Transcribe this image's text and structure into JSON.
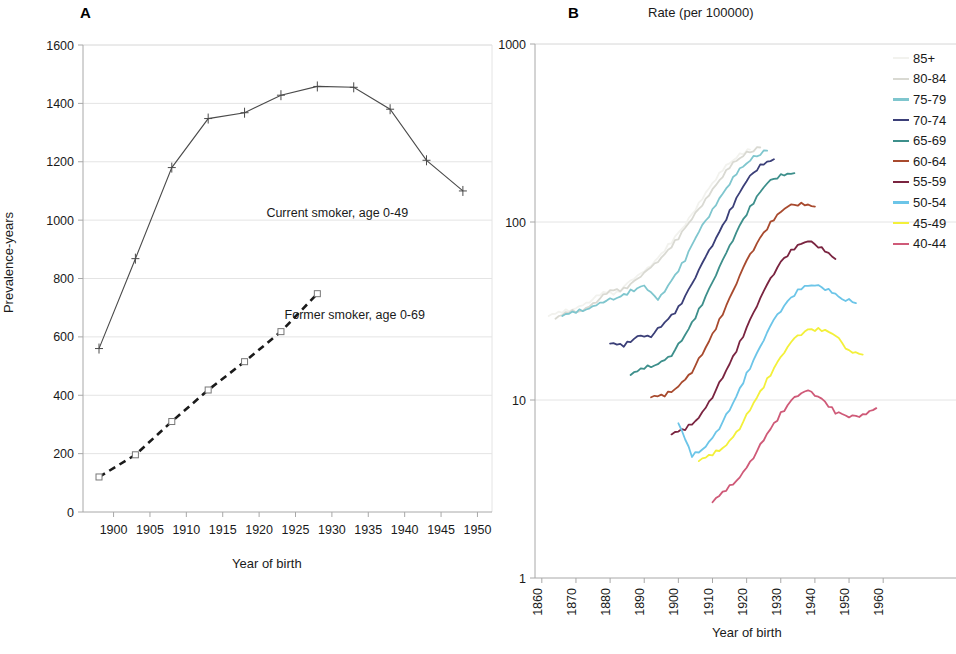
{
  "figure": {
    "panel_a_letter": "A",
    "panel_b_letter": "B",
    "panel_b_title": "Rate (per 100000)"
  },
  "chart_data": [
    {
      "id": "panel_a",
      "type": "line",
      "title": "A",
      "xlabel": "Year of birth",
      "ylabel": "Prevalence-years",
      "xlim": [
        1895.8,
        1952.0
      ],
      "ylim": [
        0,
        1600
      ],
      "xticks": [
        1900,
        1905,
        1910,
        1915,
        1920,
        1925,
        1930,
        1935,
        1940,
        1945,
        1950
      ],
      "yticks": [
        0,
        200,
        400,
        600,
        800,
        1000,
        1200,
        1400,
        1600
      ],
      "grid": true,
      "annotations": [
        {
          "text": "Current smoker, age 0-49",
          "x": 1921.0,
          "y": 1010
        },
        {
          "text": "Former smoker, age 0-69",
          "x": 1923.5,
          "y": 660
        }
      ],
      "series": [
        {
          "name": "Current smoker, age 0-49",
          "marker": "plus",
          "linestyle": "solid",
          "color": "#4a4a4a",
          "x": [
            1898,
            1903,
            1908,
            1913,
            1918,
            1923,
            1928,
            1933,
            1938,
            1943,
            1948
          ],
          "values": [
            560,
            868,
            1180,
            1348,
            1368,
            1428,
            1458,
            1455,
            1380,
            1205,
            1100
          ]
        },
        {
          "name": "Former smoker, age 0-69",
          "marker": "square",
          "linestyle": "dashed",
          "color": "#1a1a1a",
          "x": [
            1898,
            1903,
            1908,
            1913,
            1918,
            1923,
            1928
          ],
          "values": [
            120,
            196,
            310,
            418,
            515,
            618,
            748
          ]
        }
      ]
    },
    {
      "id": "panel_b",
      "type": "line",
      "title": "Rate (per 100000)",
      "xlabel": "Year of birth",
      "ylabel": "",
      "yscale": "log",
      "xlim": [
        1858,
        1962
      ],
      "ylim": [
        1,
        1000
      ],
      "xticks": [
        1860,
        1870,
        1880,
        1890,
        1900,
        1910,
        1920,
        1930,
        1940,
        1950,
        1960
      ],
      "yticks": [
        1,
        10,
        100,
        1000
      ],
      "ytick_labels": [
        "1",
        "10",
        "100",
        "1000"
      ],
      "grid": true,
      "legend_position": "right",
      "series": [
        {
          "name": "85+",
          "color": "#f2f2ee",
          "x": [
            1862,
            1866,
            1870,
            1874,
            1878,
            1882,
            1886,
            1890,
            1894,
            1898,
            1902,
            1906,
            1910,
            1914,
            1918,
            1921
          ],
          "values": [
            30,
            31,
            33,
            36,
            40,
            40,
            47,
            52,
            63,
            78,
            96,
            128,
            166,
            205,
            240,
            255
          ]
        },
        {
          "name": "80-84",
          "color": "#d9d9d2",
          "x": [
            1864,
            1868,
            1872,
            1876,
            1880,
            1884,
            1888,
            1892,
            1896,
            1900,
            1904,
            1908,
            1912,
            1916,
            1920,
            1924
          ],
          "values": [
            29,
            31,
            32,
            36,
            41,
            42,
            48,
            55,
            66,
            82,
            104,
            135,
            172,
            212,
            245,
            262
          ]
        },
        {
          "name": "75-79",
          "color": "#7fc6ce",
          "x": [
            1866,
            1870,
            1874,
            1878,
            1882,
            1886,
            1890,
            1894,
            1898,
            1902,
            1906,
            1910,
            1914,
            1918,
            1922,
            1926
          ],
          "values": [
            30,
            31,
            33,
            36,
            37,
            41,
            44,
            36,
            47,
            62,
            88,
            118,
            155,
            196,
            232,
            252
          ]
        },
        {
          "name": "70-74",
          "color": "#3b3f78",
          "x": [
            1880,
            1884,
            1888,
            1892,
            1896,
            1900,
            1904,
            1908,
            1912,
            1916,
            1920,
            1924,
            1928
          ],
          "values": [
            21,
            20,
            23,
            23,
            27,
            33,
            45,
            63,
            88,
            125,
            170,
            210,
            225
          ]
        },
        {
          "name": "65-69",
          "color": "#3d8f8b",
          "x": [
            1886,
            1890,
            1894,
            1898,
            1902,
            1906,
            1910,
            1914,
            1918,
            1922,
            1926,
            1930,
            1934
          ],
          "values": [
            14,
            15,
            16,
            18,
            23,
            32,
            46,
            66,
            96,
            130,
            165,
            185,
            188
          ]
        },
        {
          "name": "60-64",
          "color": "#a84a2e",
          "x": [
            1892,
            1896,
            1900,
            1904,
            1908,
            1912,
            1916,
            1920,
            1924,
            1928,
            1932,
            1936,
            1940
          ],
          "values": [
            10.5,
            10.5,
            12,
            14.5,
            19.5,
            28,
            41,
            60,
            82,
            105,
            122,
            128,
            122
          ]
        },
        {
          "name": "55-59",
          "color": "#7a2440",
          "x": [
            1898,
            1902,
            1906,
            1910,
            1914,
            1918,
            1922,
            1926,
            1930,
            1934,
            1938,
            1942,
            1946
          ],
          "values": [
            6.5,
            6.8,
            8.0,
            10.5,
            14.5,
            21,
            31,
            44,
            60,
            72,
            78,
            72,
            62
          ]
        },
        {
          "name": "50-54",
          "color": "#6cc5e8",
          "x": [
            1900,
            1904,
            1908,
            1912,
            1916,
            1920,
            1924,
            1928,
            1932,
            1936,
            1940,
            1944,
            1948,
            1952
          ],
          "values": [
            7.5,
            4.8,
            5.5,
            7.0,
            9.5,
            14,
            20,
            28,
            36,
            43,
            44,
            42,
            37,
            35
          ]
        },
        {
          "name": "45-49",
          "color": "#f3f03a",
          "x": [
            1906,
            1910,
            1914,
            1918,
            1922,
            1926,
            1930,
            1934,
            1938,
            1942,
            1946,
            1950,
            1954
          ],
          "values": [
            4.6,
            4.9,
            5.6,
            7.0,
            9.5,
            13,
            17.5,
            22,
            25,
            25,
            23,
            19,
            18
          ]
        },
        {
          "name": "40-44",
          "color": "#cf5a78",
          "x": [
            1910,
            1914,
            1918,
            1922,
            1926,
            1930,
            1934,
            1938,
            1942,
            1946,
            1950,
            1954,
            1958
          ],
          "values": [
            2.7,
            3.1,
            3.7,
            4.8,
            6.4,
            8.4,
            10.4,
            11.2,
            10.2,
            8.6,
            8.0,
            8.3,
            9.0
          ]
        }
      ]
    }
  ],
  "legend": {
    "items": [
      {
        "label": "85+",
        "color": "#f2f2ee"
      },
      {
        "label": "80-84",
        "color": "#d9d9d2"
      },
      {
        "label": "75-79",
        "color": "#7fc6ce"
      },
      {
        "label": "70-74",
        "color": "#3b3f78"
      },
      {
        "label": "65-69",
        "color": "#3d8f8b"
      },
      {
        "label": "60-64",
        "color": "#a84a2e"
      },
      {
        "label": "55-59",
        "color": "#7a2440"
      },
      {
        "label": "50-54",
        "color": "#6cc5e8"
      },
      {
        "label": "45-49",
        "color": "#f3f03a"
      },
      {
        "label": "40-44",
        "color": "#cf5a78"
      }
    ]
  }
}
